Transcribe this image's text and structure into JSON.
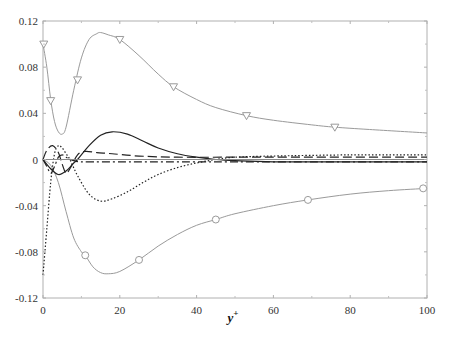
{
  "chart_data": {
    "type": "line",
    "title": "",
    "xlabel": "y+",
    "xlabel_main": "y",
    "xlabel_sup": "+",
    "ylabel": "",
    "xlim": [
      0,
      100
    ],
    "ylim": [
      -0.12,
      0.12
    ],
    "grid": false,
    "legend": null,
    "xticks": [
      0,
      20,
      40,
      60,
      80,
      100
    ],
    "xtick_labels": [
      "0",
      "20",
      "40",
      "60",
      "80",
      "100"
    ],
    "yticks": [
      -0.12,
      -0.08,
      -0.04,
      0,
      0.04,
      0.08,
      0.12
    ],
    "ytick_labels": [
      "-0.12",
      "-0.08",
      "-0.04",
      "0",
      "0.04",
      "0.08",
      "0.12"
    ],
    "series": [
      {
        "name": "upper-gray-triangles",
        "style": "solid",
        "color": "#9a9a9a",
        "marker": "triangle-down",
        "x": [
          0,
          1,
          2,
          3,
          4,
          5,
          6,
          8,
          10,
          12,
          14,
          15,
          17,
          20,
          25,
          30,
          34,
          40,
          45,
          53,
          60,
          70,
          76,
          85,
          100
        ],
        "y": [
          0.1,
          0.08,
          0.052,
          0.033,
          0.024,
          0.022,
          0.028,
          0.06,
          0.088,
          0.104,
          0.109,
          0.11,
          0.108,
          0.104,
          0.09,
          0.074,
          0.063,
          0.052,
          0.045,
          0.038,
          0.034,
          0.03,
          0.028,
          0.026,
          0.023
        ],
        "marker_x": [
          0.2,
          2,
          9,
          20,
          34,
          53,
          76
        ],
        "marker_y": [
          0.1,
          0.051,
          0.069,
          0.104,
          0.063,
          0.038,
          0.028
        ]
      },
      {
        "name": "lower-gray-circles",
        "style": "solid",
        "color": "#9a9a9a",
        "marker": "circle",
        "x": [
          0,
          2,
          4,
          6,
          8,
          10,
          11,
          13,
          15,
          17,
          20,
          25,
          30,
          35,
          40,
          45,
          50,
          60,
          69,
          80,
          90,
          100
        ],
        "y": [
          0.0,
          -0.005,
          -0.02,
          -0.045,
          -0.068,
          -0.08,
          -0.083,
          -0.093,
          -0.098,
          -0.099,
          -0.097,
          -0.087,
          -0.075,
          -0.065,
          -0.057,
          -0.052,
          -0.047,
          -0.04,
          -0.035,
          -0.03,
          -0.027,
          -0.025
        ],
        "marker_x": [
          11,
          25,
          45,
          69,
          99
        ],
        "marker_y": [
          -0.083,
          -0.087,
          -0.052,
          -0.035,
          -0.025
        ]
      },
      {
        "name": "black-solid",
        "style": "solid",
        "color": "#222222",
        "marker": null,
        "x": [
          0,
          2,
          4,
          6,
          8,
          9,
          12,
          15,
          18,
          22,
          26,
          30,
          35,
          40,
          45,
          50,
          60,
          80,
          100
        ],
        "y": [
          0.0,
          -0.008,
          -0.013,
          -0.01,
          -0.003,
          0.0,
          0.012,
          0.021,
          0.024,
          0.022,
          0.016,
          0.01,
          0.005,
          0.002,
          0.0,
          -0.001,
          -0.002,
          -0.002,
          -0.002
        ]
      },
      {
        "name": "black-dotted",
        "style": "dotted",
        "color": "#222222",
        "marker": null,
        "x": [
          0,
          1,
          2,
          3,
          4,
          5,
          6,
          7,
          9,
          12,
          15,
          18,
          22,
          26,
          30,
          35,
          40,
          45,
          50,
          60,
          80,
          100
        ],
        "y": [
          -0.1,
          -0.06,
          -0.02,
          0.005,
          0.012,
          0.01,
          0.005,
          0.0,
          -0.014,
          -0.03,
          -0.036,
          -0.034,
          -0.028,
          -0.02,
          -0.013,
          -0.007,
          -0.003,
          0.0,
          0.002,
          0.003,
          0.004,
          0.004
        ]
      },
      {
        "name": "black-long-dash",
        "style": "dashed",
        "color": "#222222",
        "marker": null,
        "x": [
          0,
          1,
          2.5,
          4,
          5,
          6,
          7,
          9,
          11,
          14,
          18,
          25,
          35,
          50,
          70,
          100
        ],
        "y": [
          0.0,
          0.008,
          0.012,
          0.006,
          -0.004,
          -0.012,
          -0.008,
          0.004,
          0.007,
          0.006,
          0.005,
          0.003,
          0.002,
          0.002,
          0.002,
          0.002
        ]
      },
      {
        "name": "black-dash-dot",
        "style": "dashdot",
        "color": "#222222",
        "marker": null,
        "x": [
          0,
          1,
          2,
          3,
          4,
          5,
          6,
          8,
          10,
          15,
          25,
          40,
          60,
          100
        ],
        "y": [
          0.0,
          -0.006,
          -0.012,
          -0.006,
          0.002,
          0.004,
          0.002,
          -0.001,
          -0.002,
          -0.002,
          -0.002,
          -0.002,
          -0.002,
          -0.002
        ]
      },
      {
        "name": "gray-zero-line",
        "style": "solid",
        "color": "#8a8a8a",
        "marker": null,
        "x": [
          0,
          100
        ],
        "y": [
          0.0,
          0.0
        ]
      }
    ]
  }
}
